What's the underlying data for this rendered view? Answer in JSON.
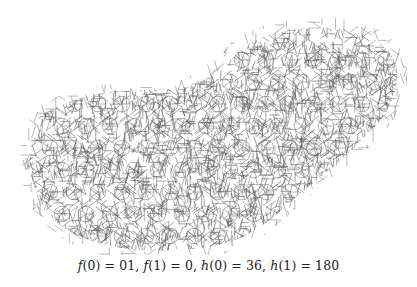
{
  "figure": {
    "stroke_color": "#555555",
    "background": "#ffffff"
  },
  "caption": {
    "parts": [
      {
        "fn": "f",
        "arg": "0",
        "value": "01"
      },
      {
        "fn": "f",
        "arg": "1",
        "value": "0"
      },
      {
        "fn": "h",
        "arg": "0",
        "value": "36"
      },
      {
        "fn": "h",
        "arg": "1",
        "value": "180"
      }
    ],
    "text": "f(0) = 01, f(1) = 0, h(0) = 36, h(1) = 180"
  }
}
